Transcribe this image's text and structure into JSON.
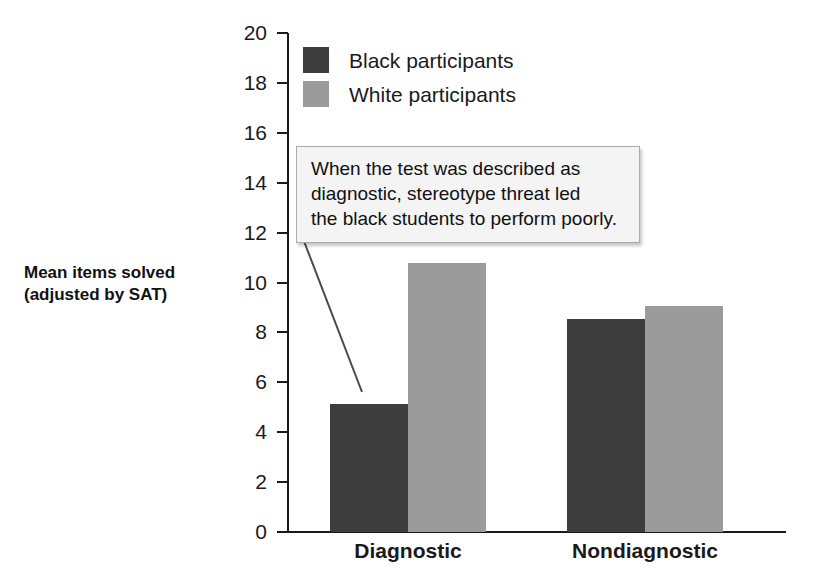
{
  "chart_data": {
    "type": "bar",
    "title": "",
    "xlabel": "",
    "ylabel": "Mean items solved\n(adjusted by SAT)",
    "ylabel_lines": [
      "Mean items solved",
      "(adjusted by SAT)"
    ],
    "categories": [
      "Diagnostic",
      "Nondiagnostic"
    ],
    "series": [
      {
        "name": "Black participants",
        "color": "#3d3d3d",
        "values": [
          5.15,
          8.55
        ]
      },
      {
        "name": "White participants",
        "color": "#9b9b9b",
        "values": [
          10.8,
          9.05
        ]
      }
    ],
    "ylim": [
      0,
      20
    ],
    "ytick_step": 2,
    "yticks": [
      20,
      18,
      16,
      14,
      12,
      10,
      8,
      6,
      4,
      2,
      0
    ],
    "ytick_labels": [
      "20",
      "18",
      "16",
      "14",
      "12",
      "10",
      "8",
      "6",
      "4",
      "2",
      "0"
    ],
    "grid": false,
    "legend_position": "top-left-inside",
    "annotations": [
      {
        "text": "When the test was described as diagnostic, stereotype threat led the black students to perform poorly.",
        "lines": [
          "When the test was described as",
          "diagnostic, stereotype threat led",
          "the black students to perform poorly."
        ],
        "points_to": {
          "category": "Diagnostic",
          "series": "Black participants"
        }
      }
    ]
  },
  "legend": {
    "items": [
      {
        "label": "Black participants",
        "color": "#3d3d3d"
      },
      {
        "label": "White participants",
        "color": "#9b9b9b"
      }
    ]
  },
  "axis": {
    "y_title_line1": "Mean items solved",
    "y_title_line2": "(adjusted by SAT)",
    "y_ticks": [
      "20",
      "18",
      "16",
      "14",
      "12",
      "10",
      "8",
      "6",
      "4",
      "2",
      "0"
    ],
    "x_categories": [
      "Diagnostic",
      "Nondiagnostic"
    ]
  },
  "callout": {
    "line1": "When the test was described as",
    "line2": "diagnostic, stereotype threat led",
    "line3": "the black students to perform poorly."
  },
  "colors": {
    "black_series": "#3d3d3d",
    "white_series": "#9b9b9b",
    "axis": "#1a1a1a",
    "callout_bg": "#f4f4f4",
    "callout_border": "#aaaaaa",
    "background": "#ffffff"
  }
}
